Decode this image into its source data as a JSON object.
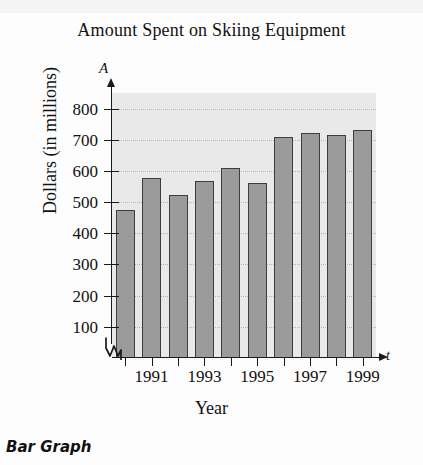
{
  "figure": {
    "caption": "Bar Graph",
    "title": "Amount Spent on Skiing Equipment"
  },
  "axes": {
    "y_symbol": "A",
    "x_symbol": "t",
    "y_title": "Dollars (in millions)",
    "x_title": "Year"
  },
  "chart_data": {
    "type": "bar",
    "title": "Amount Spent on Skiing Equipment",
    "xlabel": "Year",
    "ylabel": "Dollars (in millions)",
    "x_axis_symbol": "t",
    "y_axis_symbol": "A",
    "categories": [
      "1990",
      "1991",
      "1992",
      "1993",
      "1994",
      "1995",
      "1996",
      "1997",
      "1998",
      "1999"
    ],
    "values": [
      475,
      578,
      523,
      568,
      608,
      562,
      708,
      722,
      715,
      730
    ],
    "x_tick_labels": [
      "",
      "1991",
      "",
      "1993",
      "",
      "1995",
      "",
      "1997",
      "",
      "1999"
    ],
    "y_ticks": [
      100,
      200,
      300,
      400,
      500,
      600,
      700,
      800
    ],
    "y_tick_labels": [
      "100",
      "200",
      "300",
      "400",
      "500",
      "600",
      "700",
      "800"
    ],
    "ylim": [
      0,
      850
    ],
    "grid": true,
    "axis_break": true,
    "legend": "none",
    "colors": {
      "bar_fill": "#9b9b9b",
      "bar_edge": "#3d3d3d",
      "plot_background": "#e9e9e9",
      "gridline": "#b4b4b4",
      "axis": "#1a1a1a",
      "page_background": "#fdfdfd"
    }
  }
}
